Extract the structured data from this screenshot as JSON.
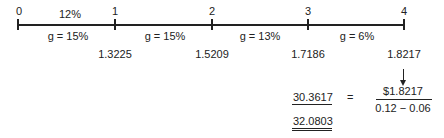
{
  "timeline": {
    "periods": [
      "0",
      "1",
      "2",
      "3",
      "4"
    ],
    "discount_rate": "12%",
    "growth_labels": [
      "g = 15%",
      "g = 15%",
      "g = 13%",
      "g = 6%"
    ],
    "dividends": [
      "1.3225",
      "1.5209",
      "1.7186",
      "1.8217"
    ]
  },
  "calculation": {
    "pv_terminal": "30.3617",
    "equals": "=",
    "numerator": "$1.8217",
    "denominator": "0.12 − 0.06",
    "total": "32.0803"
  }
}
